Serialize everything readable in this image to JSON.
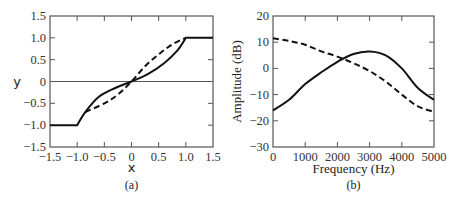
{
  "chart_data": [
    {
      "type": "line",
      "panel_label": "(a)",
      "title": "",
      "xlabel": "x",
      "ylabel": "y",
      "xlim": [
        -1.5,
        1.5
      ],
      "ylim": [
        -1.5,
        1.5
      ],
      "xticks": [
        "−1.5",
        "−1.0",
        "−0.5",
        "0",
        "0.5",
        "1.0",
        "1.5"
      ],
      "yticks": [
        "1.5",
        "1.0",
        "0.5",
        "0",
        "−0.5",
        "−1.0",
        "−1.5"
      ],
      "grid": false,
      "zero_line": true,
      "series": [
        {
          "name": "solid",
          "style": "solid",
          "x": [
            -1.5,
            -1.0,
            -0.85,
            -0.6,
            -0.3,
            0,
            0.3,
            0.6,
            0.85,
            1.0,
            1.5
          ],
          "y": [
            -1.0,
            -1.0,
            -0.7,
            -0.35,
            -0.15,
            0,
            0.17,
            0.42,
            0.72,
            1.0,
            1.0
          ]
        },
        {
          "name": "dashed",
          "style": "dashed",
          "x": [
            -0.85,
            -0.5,
            -0.25,
            0,
            0.25,
            0.5,
            0.75,
            1.0
          ],
          "y": [
            -0.7,
            -0.5,
            -0.3,
            0,
            0.35,
            0.62,
            0.85,
            1.0
          ]
        }
      ]
    },
    {
      "type": "line",
      "panel_label": "(b)",
      "title": "",
      "xlabel": "Frequency (Hz)",
      "ylabel": "Amplitude (dB)",
      "xlim": [
        0,
        5000
      ],
      "ylim": [
        -30,
        20
      ],
      "xticks": [
        "0",
        "1000",
        "2000",
        "3000",
        "4000",
        "5000"
      ],
      "yticks": [
        "20",
        "10",
        "0",
        "−10",
        "−20",
        "−30"
      ],
      "grid": false,
      "series": [
        {
          "name": "solid",
          "style": "solid",
          "x": [
            0,
            500,
            1000,
            1500,
            2000,
            2500,
            3000,
            3500,
            4000,
            4500,
            5000
          ],
          "y": [
            -16,
            -12,
            -6,
            -1.5,
            2.5,
            5.5,
            6.5,
            5,
            0,
            -7.5,
            -12
          ]
        },
        {
          "name": "dashed",
          "style": "dashed",
          "x": [
            0,
            500,
            1000,
            1500,
            2000,
            2500,
            3000,
            3500,
            4000,
            4500,
            5000
          ],
          "y": [
            11.5,
            10.5,
            9,
            6.5,
            4.5,
            2,
            -1,
            -5,
            -10,
            -14.5,
            -16.5
          ]
        }
      ]
    }
  ]
}
